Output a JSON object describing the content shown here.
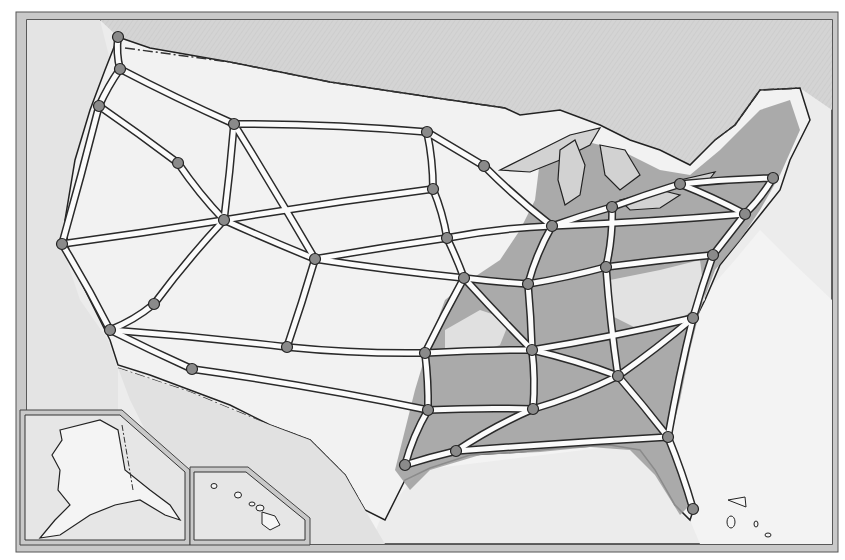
{
  "map": {
    "type": "illustrated-road-map",
    "subject": "United States interstate highway network",
    "colors": {
      "background": "#ffffff",
      "frame": "#c8c8c8",
      "frame_line": "#444444",
      "water": "#d6d6d6",
      "ocean_light": "#ebebeb",
      "land_light": "#f1f1f1",
      "land_mid": "#cfcfcf",
      "land_dark": "#9a9a9a",
      "road_fill": "#fbfbfb",
      "road_edge": "#2a2a2a",
      "node": "#8a8a8a",
      "border_dash": "#333333"
    },
    "insets": [
      {
        "name": "alaska-inset"
      },
      {
        "name": "hawaii-inset"
      }
    ],
    "nodes": [
      {
        "id": "bellingham",
        "x": 118,
        "y": 37
      },
      {
        "id": "seattle",
        "x": 120,
        "y": 69
      },
      {
        "id": "portland",
        "x": 99,
        "y": 106
      },
      {
        "id": "spokane-w",
        "x": 178,
        "y": 163
      },
      {
        "id": "billings",
        "x": 234,
        "y": 124
      },
      {
        "id": "fargo",
        "x": 427,
        "y": 132
      },
      {
        "id": "duluth",
        "x": 484,
        "y": 166
      },
      {
        "id": "sf",
        "x": 62,
        "y": 244
      },
      {
        "id": "reno",
        "x": 224,
        "y": 220
      },
      {
        "id": "sioux",
        "x": 433,
        "y": 189
      },
      {
        "id": "desmoines",
        "x": 447,
        "y": 238
      },
      {
        "id": "cheyenne",
        "x": 315,
        "y": 259
      },
      {
        "id": "kc",
        "x": 464,
        "y": 278
      },
      {
        "id": "chicago",
        "x": 552,
        "y": 226
      },
      {
        "id": "detroit",
        "x": 612,
        "y": 207
      },
      {
        "id": "buffalo",
        "x": 680,
        "y": 184
      },
      {
        "id": "boston",
        "x": 773,
        "y": 178
      },
      {
        "id": "nyc",
        "x": 745,
        "y": 214
      },
      {
        "id": "dc",
        "x": 713,
        "y": 255
      },
      {
        "id": "indy",
        "x": 528,
        "y": 284
      },
      {
        "id": "cincy",
        "x": 606,
        "y": 267
      },
      {
        "id": "lasvegas",
        "x": 154,
        "y": 304
      },
      {
        "id": "la",
        "x": 110,
        "y": 330
      },
      {
        "id": "phoenix-n",
        "x": 192,
        "y": 369
      },
      {
        "id": "albuquerque",
        "x": 287,
        "y": 347
      },
      {
        "id": "okc",
        "x": 425,
        "y": 353
      },
      {
        "id": "memphis",
        "x": 532,
        "y": 350
      },
      {
        "id": "charlotte",
        "x": 693,
        "y": 318
      },
      {
        "id": "atlanta",
        "x": 618,
        "y": 376
      },
      {
        "id": "dallas",
        "x": 428,
        "y": 410
      },
      {
        "id": "jackson",
        "x": 533,
        "y": 409
      },
      {
        "id": "houston",
        "x": 405,
        "y": 465
      },
      {
        "id": "neworleans",
        "x": 456,
        "y": 451
      },
      {
        "id": "jacksonville",
        "x": 668,
        "y": 437
      },
      {
        "id": "miami",
        "x": 693,
        "y": 509
      }
    ],
    "roads": [
      [
        "bellingham",
        "seattle"
      ],
      [
        "seattle",
        "portland"
      ],
      [
        "portland",
        "sf"
      ],
      [
        "sf",
        "la"
      ],
      [
        "seattle",
        "billings"
      ],
      [
        "portland",
        "spokane-w"
      ],
      [
        "spokane-w",
        "reno"
      ],
      [
        "billings",
        "fargo"
      ],
      [
        "fargo",
        "duluth"
      ],
      [
        "fargo",
        "sioux"
      ],
      [
        "sioux",
        "desmoines"
      ],
      [
        "desmoines",
        "kc"
      ],
      [
        "reno",
        "cheyenne"
      ],
      [
        "sf",
        "reno"
      ],
      [
        "reno",
        "sioux"
      ],
      [
        "cheyenne",
        "kc"
      ],
      [
        "kc",
        "indy"
      ],
      [
        "indy",
        "cincy"
      ],
      [
        "desmoines",
        "chicago"
      ],
      [
        "chicago",
        "detroit"
      ],
      [
        "detroit",
        "buffalo"
      ],
      [
        "buffalo",
        "boston"
      ],
      [
        "chicago",
        "nyc"
      ],
      [
        "nyc",
        "boston"
      ],
      [
        "nyc",
        "dc"
      ],
      [
        "dc",
        "charlotte"
      ],
      [
        "cincy",
        "dc"
      ],
      [
        "indy",
        "chicago"
      ],
      [
        "la",
        "lasvegas"
      ],
      [
        "lasvegas",
        "reno"
      ],
      [
        "la",
        "albuquerque"
      ],
      [
        "albuquerque",
        "okc"
      ],
      [
        "okc",
        "memphis"
      ],
      [
        "memphis",
        "charlotte"
      ],
      [
        "la",
        "phoenix-n"
      ],
      [
        "phoenix-n",
        "dallas"
      ],
      [
        "dallas",
        "jackson"
      ],
      [
        "jackson",
        "atlanta"
      ],
      [
        "atlanta",
        "charlotte"
      ],
      [
        "dallas",
        "houston"
      ],
      [
        "houston",
        "neworleans"
      ],
      [
        "neworleans",
        "jacksonville"
      ],
      [
        "jacksonville",
        "miami"
      ],
      [
        "charlotte",
        "jacksonville"
      ],
      [
        "okc",
        "dallas"
      ],
      [
        "kc",
        "okc"
      ],
      [
        "memphis",
        "jackson"
      ],
      [
        "indy",
        "memphis"
      ],
      [
        "cincy",
        "atlanta"
      ],
      [
        "albuquerque",
        "cheyenne"
      ],
      [
        "billings",
        "reno"
      ],
      [
        "duluth",
        "chicago"
      ],
      [
        "memphis",
        "atlanta"
      ],
      [
        "kc",
        "memphis"
      ],
      [
        "jackson",
        "neworleans"
      ],
      [
        "atlanta",
        "jacksonville"
      ],
      [
        "detroit",
        "cincy"
      ],
      [
        "cheyenne",
        "desmoines"
      ],
      [
        "buffalo",
        "nyc"
      ],
      [
        "billings",
        "cheyenne"
      ]
    ]
  }
}
